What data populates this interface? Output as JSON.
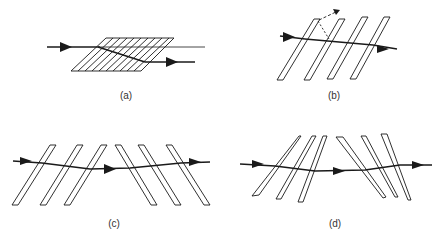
{
  "panels": [
    {
      "id": "a",
      "label": "(a)",
      "description": "Pile of many closely stacked thin plates at oblique incidence; beam enters from left, is displaced laterally and exits lower"
    },
    {
      "id": "b",
      "label": "(b)",
      "description": "Four separated tilted plates; transmitted beam with a dashed reflected ray from the first plate"
    },
    {
      "id": "c",
      "label": "(c)",
      "description": "Six plates: three tilted one way, three tilted the opposite way, beam displacement compensated"
    },
    {
      "id": "d",
      "label": "(d)",
      "description": "Six wedge-shaped plates in opposing orientations, beam displaced and restored"
    }
  ],
  "colors": {
    "line": "#1a1a1a",
    "background": "#ffffff"
  }
}
